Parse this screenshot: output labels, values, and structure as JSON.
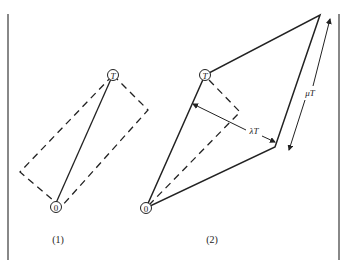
{
  "figure": {
    "panels": [
      {
        "caption": "(1)",
        "origin_label": "0",
        "target_label": "T"
      },
      {
        "caption": "(2)",
        "origin_label": "0",
        "target_label": "T",
        "width_label": "λT",
        "length_label": "μT"
      }
    ],
    "colors": {
      "stroke": "#222222",
      "border": "#888888",
      "background": "#ffffff"
    }
  }
}
